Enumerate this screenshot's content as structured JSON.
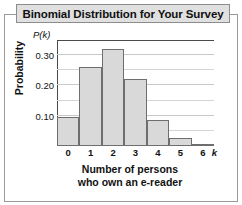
{
  "title": "Binomial Distribution for Your Survey",
  "axis": {
    "ylabel": "Probability",
    "y_symbol": "P(k)",
    "xlabel_line1": "Number of persons",
    "xlabel_line2": "who own an e-reader",
    "x_symbol": "k"
  },
  "colors": {
    "bar_fill": "#d9d9d9",
    "bar_edge": "#6e6e6e",
    "axis": "#4a4a4a",
    "grid": "#d5d5d5",
    "title_bar": "#e0e0e0",
    "frame": "#9a9a9a",
    "text": "#111111"
  },
  "chart_data": {
    "type": "bar",
    "title": "Binomial Distribution for Your Survey",
    "xlabel": "Number of persons who own an e-reader",
    "ylabel": "Probability",
    "categories": [
      "0",
      "1",
      "2",
      "3",
      "4",
      "5",
      "6"
    ],
    "x": [
      0,
      1,
      2,
      3,
      4,
      5,
      6
    ],
    "values": [
      0.095,
      0.26,
      0.32,
      0.22,
      0.085,
      0.025,
      0.003
    ],
    "ylim": [
      0,
      0.35
    ],
    "xlim": [
      -0.5,
      6.5
    ],
    "ytick_labels": [
      "0.10",
      "0.20",
      "0.30"
    ],
    "ytick_values": [
      0.1,
      0.2,
      0.3
    ],
    "xtick_labels": [
      "0",
      "1",
      "2",
      "3",
      "4",
      "5",
      "6"
    ],
    "gridlines": [
      0.05,
      0.1,
      0.15,
      0.2,
      0.25,
      0.3
    ],
    "grid": true,
    "legend": false
  }
}
